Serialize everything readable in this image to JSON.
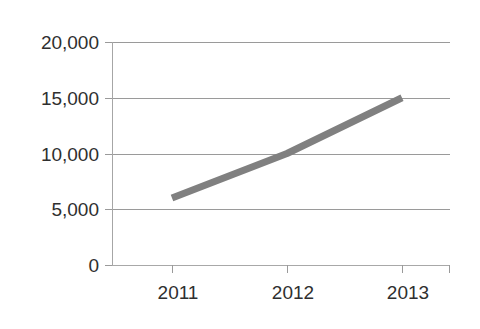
{
  "chart_data": {
    "type": "line",
    "title": "",
    "subtitle": "",
    "xlabel": "",
    "ylabel": "",
    "categories": [
      "2011",
      "2012",
      "2013"
    ],
    "x": [
      2011,
      2012,
      2013
    ],
    "series": [
      {
        "name": "",
        "values": [
          6000,
          10000,
          15000
        ],
        "color": "#808080",
        "line_width": 7,
        "marker": "none"
      }
    ],
    "ylim": [
      0,
      20000
    ],
    "yticks": [
      0,
      5000,
      10000,
      15000,
      20000
    ],
    "ytick_labels": [
      "0",
      "5,000",
      "10,000",
      "15,000",
      "20,000"
    ],
    "xtick_labels": [
      "2011",
      "2012",
      "2013"
    ],
    "grid": {
      "horizontal": true,
      "vertical": false,
      "color": "#9a9a9a"
    },
    "legend": {
      "visible": false,
      "position": "none",
      "entries": []
    },
    "axis": {
      "y_axis_line": true,
      "x_axis_line": true,
      "tick_marks": true,
      "axis_color": "#a6a6a6"
    },
    "background": "#ffffff",
    "annotations": []
  },
  "axes": {
    "y_tick_labels": [
      {
        "value": 20000,
        "label": "20,000"
      },
      {
        "value": 15000,
        "label": "15,000"
      },
      {
        "value": 10000,
        "label": "10,000"
      },
      {
        "value": 5000,
        "label": "5,000"
      },
      {
        "value": 0,
        "label": "0"
      }
    ],
    "x_tick_labels": [
      {
        "value": 2011,
        "label": "2011"
      },
      {
        "value": 2012,
        "label": "2012"
      },
      {
        "value": 2013,
        "label": "2013"
      }
    ]
  }
}
